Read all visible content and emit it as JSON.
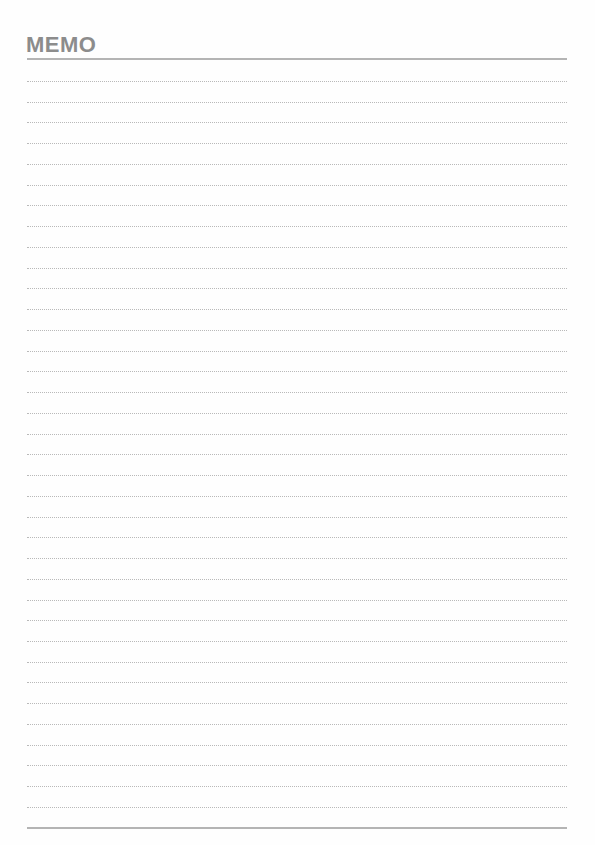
{
  "header": {
    "title": "MEMO"
  },
  "ruled_lines": {
    "count": 36,
    "first_y": 81,
    "spacing": 20.74,
    "style": "dotted",
    "color": "#b9b9b9"
  },
  "colors": {
    "title": "#8c8c8c",
    "rule": "#b4b4b4",
    "background": "#fefefe"
  }
}
